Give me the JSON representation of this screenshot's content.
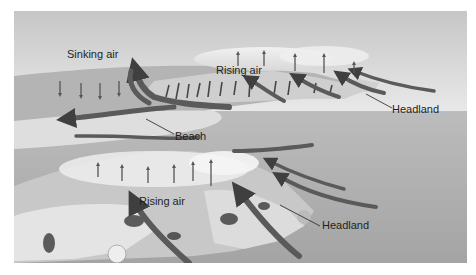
{
  "figure": {
    "palette": {
      "sky_top": "#c9c9c9",
      "sky_bottom": "#ececec",
      "sea": "#a9a9a9",
      "land": "#bdbdbd",
      "rock_light": "#e6e6e6",
      "rock_dark": "#3a3a3a",
      "flow_arrow": "#5a5a5a",
      "vertical_arrow": "#4a4a4a",
      "label_text": "#1f1f1f"
    },
    "labels": {
      "sinking_air": "Sinking air",
      "rising_air_top": "Rising air",
      "beach": "Beach",
      "headland_top": "Headland",
      "rising_air_bottom": "Rising air",
      "headland_bottom": "Headland"
    },
    "arrows": {
      "sinking_air_count": 4,
      "rising_air_top_count": 5,
      "rising_air_bottom_count": 6,
      "onshore_flow_top_count": 4,
      "onshore_flow_bottom_count": 4
    }
  }
}
